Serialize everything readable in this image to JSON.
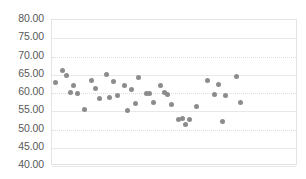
{
  "chart_data": {
    "type": "scatter",
    "title": "",
    "xlabel": "",
    "ylabel": "",
    "ylim": [
      40,
      80
    ],
    "xlim": [
      0,
      68
    ],
    "grid": true,
    "legend": false,
    "series_color": "#8c8c8c",
    "y_ticks": [
      "80.00",
      "75.00",
      "70.00",
      "65.00",
      "60.00",
      "55.00",
      "50.00",
      "45.00",
      "40.00"
    ],
    "y_tick_values": [
      80,
      75,
      70,
      65,
      60,
      55,
      50,
      45,
      40
    ],
    "x_ticks": [],
    "series": [
      {
        "name": "Series 1",
        "points": [
          {
            "x": 1,
            "y": 63.0
          },
          {
            "x": 3,
            "y": 66.3
          },
          {
            "x": 4,
            "y": 64.8
          },
          {
            "x": 5,
            "y": 60.2
          },
          {
            "x": 6,
            "y": 62.0
          },
          {
            "x": 7,
            "y": 59.8
          },
          {
            "x": 9,
            "y": 55.4
          },
          {
            "x": 11,
            "y": 63.4
          },
          {
            "x": 12,
            "y": 61.1
          },
          {
            "x": 13,
            "y": 58.6
          },
          {
            "x": 15,
            "y": 65.2
          },
          {
            "x": 16,
            "y": 58.7
          },
          {
            "x": 17,
            "y": 63.1
          },
          {
            "x": 18,
            "y": 59.2
          },
          {
            "x": 20,
            "y": 62.0
          },
          {
            "x": 21,
            "y": 55.2
          },
          {
            "x": 22,
            "y": 61.0
          },
          {
            "x": 23,
            "y": 57.2
          },
          {
            "x": 24,
            "y": 64.3
          },
          {
            "x": 26,
            "y": 59.9
          },
          {
            "x": 27,
            "y": 60.0
          },
          {
            "x": 28,
            "y": 57.4
          },
          {
            "x": 30,
            "y": 62.1
          },
          {
            "x": 31,
            "y": 60.2
          },
          {
            "x": 32,
            "y": 59.6
          },
          {
            "x": 33,
            "y": 56.9
          },
          {
            "x": 35,
            "y": 52.8
          },
          {
            "x": 36,
            "y": 53.0
          },
          {
            "x": 37,
            "y": 51.3
          },
          {
            "x": 38,
            "y": 52.7
          },
          {
            "x": 40,
            "y": 56.3
          },
          {
            "x": 43,
            "y": 63.4
          },
          {
            "x": 45,
            "y": 59.5
          },
          {
            "x": 46,
            "y": 62.2
          },
          {
            "x": 47,
            "y": 52.2
          },
          {
            "x": 48,
            "y": 59.4
          },
          {
            "x": 51,
            "y": 64.5
          },
          {
            "x": 52,
            "y": 57.4
          }
        ]
      }
    ]
  }
}
